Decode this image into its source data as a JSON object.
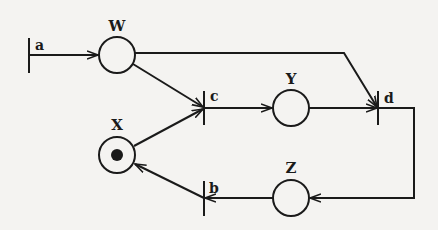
{
  "diagram": {
    "type": "petri-net",
    "colors": {
      "ink": "#1a1a1a",
      "background": "#f4f3f1"
    },
    "places": [
      {
        "id": "W",
        "label": "W",
        "cx": 117,
        "cy": 55,
        "tokens": 0
      },
      {
        "id": "X",
        "label": "X",
        "cx": 117,
        "cy": 155,
        "tokens": 1
      },
      {
        "id": "Y",
        "label": "Y",
        "cx": 291,
        "cy": 108,
        "tokens": 0
      },
      {
        "id": "Z",
        "label": "Z",
        "cx": 291,
        "cy": 198,
        "tokens": 0
      }
    ],
    "transitions": [
      {
        "id": "a",
        "label": "a",
        "x": 29,
        "y1": 38,
        "y2": 73
      },
      {
        "id": "b",
        "label": "b",
        "x": 204,
        "y1": 181,
        "y2": 216
      },
      {
        "id": "c",
        "label": "c",
        "x": 204,
        "y1": 91,
        "y2": 125
      },
      {
        "id": "d",
        "label": "d",
        "x": 378,
        "y1": 91,
        "y2": 125
      }
    ],
    "arcs": [
      {
        "from": "a",
        "to": "W"
      },
      {
        "from": "W",
        "to": "c"
      },
      {
        "from": "W",
        "to": "d"
      },
      {
        "from": "X",
        "to": "c"
      },
      {
        "from": "c",
        "to": "Y"
      },
      {
        "from": "Y",
        "to": "d"
      },
      {
        "from": "d",
        "to": "Z"
      },
      {
        "from": "Z",
        "to": "b"
      },
      {
        "from": "b",
        "to": "X"
      }
    ]
  }
}
